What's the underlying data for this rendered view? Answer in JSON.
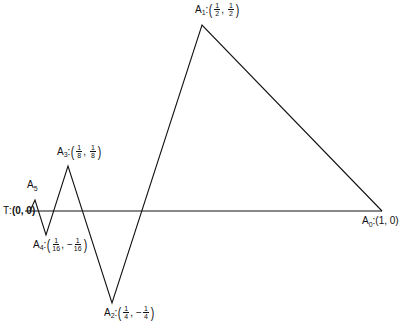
{
  "diagram": {
    "type": "zigzag-polyline",
    "line_color": "#111111",
    "axis": {
      "from": [
        25,
        211
      ],
      "to": [
        382,
        211
      ]
    },
    "vertices": [
      {
        "id": "T",
        "px": [
          30,
          211
        ],
        "label": "T",
        "coord": "(0, 0)"
      },
      {
        "id": "A5",
        "px": [
          35,
          200
        ],
        "label": "A",
        "sub": "5"
      },
      {
        "id": "A4",
        "px": [
          46,
          235
        ],
        "label": "A",
        "sub": "4",
        "x_num": "1",
        "x_den": "16",
        "y_sign": "−",
        "y_num": "1",
        "y_den": "16"
      },
      {
        "id": "A3",
        "px": [
          68,
          166
        ],
        "label": "A",
        "sub": "3",
        "x_num": "1",
        "x_den": "8",
        "y_sign": "",
        "y_num": "1",
        "y_den": "8"
      },
      {
        "id": "A2",
        "px": [
          112,
          303
        ],
        "label": "A",
        "sub": "2",
        "x_num": "1",
        "x_den": "4",
        "y_sign": "−",
        "y_num": "1",
        "y_den": "4"
      },
      {
        "id": "A1",
        "px": [
          202,
          25
        ],
        "label": "A",
        "sub": "1",
        "x_num": "1",
        "x_den": "2",
        "y_sign": "",
        "y_num": "1",
        "y_den": "2"
      },
      {
        "id": "A0",
        "px": [
          382,
          211
        ],
        "label": "A",
        "sub": "0",
        "coord": "(1, 0)"
      }
    ]
  },
  "labels": {
    "t": {
      "name": "T",
      "sep": ":",
      "coord": "(0, 0)"
    },
    "a5": {
      "letter": "A",
      "sub": "5"
    },
    "a4": {
      "letter": "A",
      "sub": "4",
      "sep": ":",
      "x_num": "1",
      "x_den": "16",
      "comma": ",",
      "y_sign": "−",
      "y_num": "1",
      "y_den": "16"
    },
    "a3": {
      "letter": "A",
      "sub": "3",
      "sep": ":",
      "x_num": "1",
      "x_den": "8",
      "comma": ",",
      "y_num": "1",
      "y_den": "8"
    },
    "a2": {
      "letter": "A",
      "sub": "2",
      "sep": ":",
      "x_num": "1",
      "x_den": "4",
      "comma": ",",
      "y_sign": "−",
      "y_num": "1",
      "y_den": "4"
    },
    "a1": {
      "letter": "A",
      "sub": "1",
      "sep": ":",
      "x_num": "1",
      "x_den": "2",
      "comma": ",",
      "y_num": "1",
      "y_den": "2"
    },
    "a0": {
      "letter": "A",
      "sub": "0",
      "sep": ":",
      "coord": "(1, 0)"
    },
    "paren_open": "(",
    "paren_close": ")"
  }
}
